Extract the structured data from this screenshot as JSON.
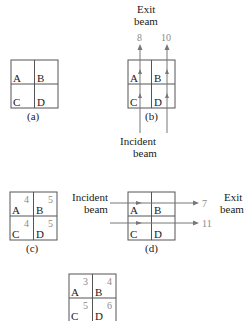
{
  "figure": {
    "colors": {
      "line": "#555555",
      "beam": "#777777",
      "numbers": "#8a8a8a",
      "text": "#1a1a1a"
    },
    "panel_a": {
      "cells": [
        "A",
        "B",
        "C",
        "D"
      ],
      "caption": "(a)"
    },
    "panel_b": {
      "cells": [
        "A",
        "B",
        "C",
        "D"
      ],
      "caption": "(b)",
      "exit_label_1": "Exit",
      "exit_label_2": "beam",
      "incident_label_1": "Incident",
      "incident_label_2": "beam",
      "sums": [
        "8",
        "10"
      ]
    },
    "panel_c": {
      "cells": [
        "A",
        "B",
        "C",
        "D"
      ],
      "values": [
        "4",
        "5",
        "4",
        "5"
      ],
      "caption": "(c)"
    },
    "panel_d": {
      "cells": [
        "A",
        "B",
        "C",
        "D"
      ],
      "caption": "(d)",
      "incident_label_1": "Incident",
      "incident_label_2": "beam",
      "exit_label_1": "Exit",
      "exit_label_2": "beam",
      "sums": [
        "7",
        "11"
      ]
    },
    "panel_e": {
      "cells": [
        "A",
        "B",
        "C",
        "D"
      ],
      "values": [
        "3",
        "4",
        "5",
        "6"
      ]
    }
  }
}
